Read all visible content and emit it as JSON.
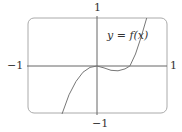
{
  "chart_data": {
    "type": "line",
    "title": "",
    "annotation": "y = f(x)",
    "xlim": [
      -1,
      1
    ],
    "ylim": [
      -1,
      1
    ],
    "tick_labels": {
      "x_left": "−1",
      "x_right": "1",
      "y_top": "1",
      "y_bottom": "−1"
    },
    "grid": false,
    "series": [
      {
        "name": "y = f(x)",
        "x": [
          -0.5,
          -0.4,
          -0.3,
          -0.2,
          -0.1,
          0.0,
          0.1,
          0.2,
          0.3,
          0.4,
          0.47,
          0.55,
          0.63,
          0.71
        ],
        "y": [
          -1.0,
          -0.6,
          -0.32,
          -0.13,
          -0.03,
          0.0,
          -0.04,
          -0.09,
          -0.1,
          -0.06,
          0.0,
          0.25,
          0.6,
          1.0
        ]
      }
    ],
    "colors": {
      "curve": "#777777",
      "axes": "#666666",
      "frame": "#999999"
    }
  }
}
